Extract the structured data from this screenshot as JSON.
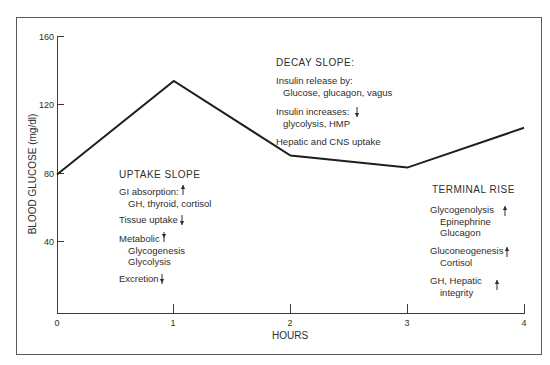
{
  "chart_data": {
    "type": "line",
    "title": "",
    "xlabel": "HOURS",
    "ylabel": "BLOOD GLUCOSE (mg/dl)",
    "x": [
      0,
      1,
      2,
      3,
      4
    ],
    "xlim": [
      0,
      4
    ],
    "ylim": [
      0,
      160
    ],
    "x_ticks": [
      "0",
      "1",
      "2",
      "3",
      "4"
    ],
    "y_ticks": [
      "40",
      "80",
      "120",
      "160"
    ],
    "grid": false,
    "legend": null,
    "series": [
      {
        "name": "Blood glucose",
        "values": [
          80,
          134,
          91,
          84,
          107
        ]
      }
    ],
    "annotations": {
      "decay_slope": {
        "title": "DECAY SLOPE:",
        "lines": [
          {
            "text": "Insulin release by:",
            "indent": false,
            "arrow": ""
          },
          {
            "text": "Glucose, glucagon, vagus",
            "indent": true,
            "arrow": ""
          },
          {
            "text": "Insulin increases:",
            "indent": false,
            "arrow": "down"
          },
          {
            "text": "glycolysis, HMP",
            "indent": true,
            "arrow": ""
          },
          {
            "text": "Hepatic and CNS uptake",
            "indent": false,
            "arrow": ""
          }
        ]
      },
      "uptake_slope": {
        "title": "UPTAKE SLOPE",
        "lines": [
          {
            "text": "GI absorption:",
            "indent": false,
            "arrow": "up"
          },
          {
            "text": "GH, thyroid, cortisol",
            "indent": true,
            "arrow": ""
          },
          {
            "text": "Tissue uptake",
            "indent": false,
            "arrow": "down"
          },
          {
            "text": "Metabolic",
            "indent": false,
            "arrow": "down"
          },
          {
            "text": "Glycogenesis",
            "indent": true,
            "arrow": ""
          },
          {
            "text": "Glycolysis",
            "indent": true,
            "arrow": ""
          },
          {
            "text": "Excretion",
            "indent": false,
            "arrow": "down"
          }
        ]
      },
      "terminal_rise": {
        "title": "TERMINAL RISE",
        "lines": [
          {
            "text": "Glycogenolysis",
            "indent": false,
            "arrow": "up"
          },
          {
            "text": "Epinephrine",
            "indent": true,
            "arrow": ""
          },
          {
            "text": "Glucagon",
            "indent": true,
            "arrow": ""
          },
          {
            "text": "Gluconeogenesis",
            "indent": false,
            "arrow": "up"
          },
          {
            "text": "Cortisol",
            "indent": true,
            "arrow": ""
          },
          {
            "text": "GH, Hepatic",
            "indent": false,
            "arrow": "up"
          },
          {
            "text": "integrity",
            "indent": true,
            "arrow": ""
          }
        ]
      }
    }
  },
  "labels": {
    "xlabel": "HOURS",
    "ylabel": "BLOOD GLUCOSE (mg/dl)",
    "x_tick_0": "0",
    "x_tick_1": "1",
    "x_tick_2": "2",
    "x_tick_3": "3",
    "x_tick_4": "4",
    "y_tick_40": "40",
    "y_tick_80": "80",
    "y_tick_120": "120",
    "y_tick_160": "160",
    "decay_title": "DECAY SLOPE:",
    "decay_1": "Insulin release by:",
    "decay_2": "Glucose, glucagon, vagus",
    "decay_3": "Insulin increases:",
    "decay_4": "glycolysis, HMP",
    "decay_5": "Hepatic and CNS uptake",
    "uptake_title": "UPTAKE SLOPE",
    "uptake_1": "GI absorption:",
    "uptake_2": "GH, thyroid, cortisol",
    "uptake_3": "Tissue uptake",
    "uptake_4": "Metabolic",
    "uptake_5": "Glycogenesis",
    "uptake_6": "Glycolysis",
    "uptake_7": "Excretion",
    "terminal_title": "TERMINAL RISE",
    "terminal_1": "Glycogenolysis",
    "terminal_2": "Epinephrine",
    "terminal_3": "Glucagon",
    "terminal_4": "Gluconeogenesis",
    "terminal_5": "Cortisol",
    "terminal_6": "GH, Hepatic",
    "terminal_7": "integrity"
  },
  "colors": {
    "line": "#1e1e1e",
    "axis": "#3a3a3a",
    "frame": "#555555",
    "text": "#2e2e2e",
    "background": "#ffffff"
  }
}
